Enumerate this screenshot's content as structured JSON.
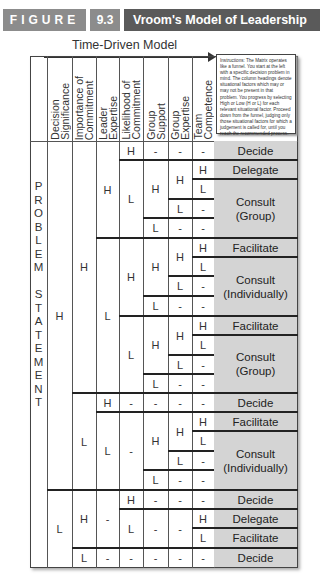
{
  "header": {
    "figure_label": "FIGURE",
    "figure_number": "9.3",
    "title": "Vroom's Model of Leadership",
    "colors": {
      "label_bg": "#8c8c8c",
      "title_bg": "#5a5a5a",
      "outcome_bg": "#d4d4d4"
    }
  },
  "model_title": "Time-Driven Model",
  "instructions": "Instructions: The Matrix operates like a funnel. You start at the left with a specific decision problem in mind. The column headings denote situational factors which may or may not be present in that problem. You progress by selecting High or Low (H or L) for each relevant situational factor. Proceed down from the funnel, judging only those situational factors for which a judgement is called for, until you reach the recommended process.",
  "row_label": "PROBLEM STATEMENT",
  "columns": [
    "Decision\nSignificance",
    "Importance of\nCommitment",
    "Leader\nExpertise",
    "Likelihood of\nCommitment",
    "Group\nSupport",
    "Group\nExpertise",
    "Team\nCompetence"
  ],
  "cells": {
    "ds_h": "H",
    "ds_l": "L",
    "ic1_h": "H",
    "ic1_l": "L",
    "ic2_h": "H",
    "ic2_l": "L",
    "le1_h": "H",
    "le1_l": "L",
    "le2_h": "H",
    "le2_l": "L",
    "le3_dash": "-",
    "le4_dash": "-",
    "H": "H",
    "L": "L",
    "dash": "-"
  },
  "outcomes": [
    "Decide",
    "Delegate",
    "Consult\n(Group)",
    "Facilitate",
    "Consult\n(Individually)",
    "Facilitate",
    "Consult\n(Group)",
    "Decide",
    "Facilitate",
    "Consult\n(Individually)",
    "Decide",
    "Delegate",
    "Facilitate",
    "Decide"
  ]
}
